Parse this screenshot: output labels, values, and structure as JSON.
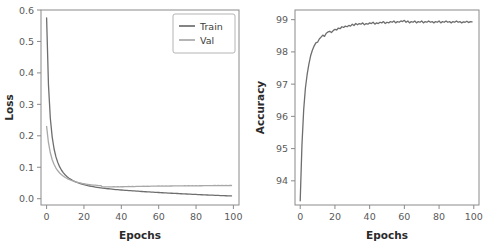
{
  "figure": {
    "background": "#ffffff",
    "panel_count": 2
  },
  "colors": {
    "train": "#6e6e6e",
    "val": "#a8a8a8",
    "accuracy": "#6e6e6e",
    "axis": "#8a8a8a",
    "tick_text": "#5a5a5a",
    "axis_title": "#2b2b2b",
    "legend_border": "#b4b4b4"
  },
  "chart_data": [
    {
      "type": "line",
      "id": "loss-chart",
      "title": "",
      "xlabel": "Epochs",
      "ylabel": "Loss",
      "xlim": [
        -3,
        103
      ],
      "ylim": [
        -0.02,
        0.6
      ],
      "xticks": [
        0,
        20,
        40,
        60,
        80,
        100
      ],
      "xtick_labels": [
        "0",
        "20",
        "40",
        "60",
        "80",
        "100"
      ],
      "yticks": [
        0.0,
        0.1,
        0.2,
        0.3,
        0.4,
        0.5,
        0.6
      ],
      "ytick_labels": [
        "0.0",
        "0.1",
        "0.2",
        "0.3",
        "0.4",
        "0.5",
        "0.6"
      ],
      "grid": false,
      "legend_position": "upper right",
      "legend_entries": [
        "Train",
        "Val"
      ],
      "x": [
        0,
        1,
        2,
        3,
        4,
        5,
        6,
        7,
        8,
        9,
        10,
        11,
        12,
        13,
        14,
        15,
        16,
        17,
        18,
        19,
        20,
        21,
        22,
        23,
        24,
        25,
        26,
        27,
        28,
        29,
        30,
        31,
        32,
        33,
        34,
        35,
        36,
        37,
        38,
        39,
        40,
        41,
        42,
        43,
        44,
        45,
        46,
        47,
        48,
        49,
        50,
        51,
        52,
        53,
        54,
        55,
        56,
        57,
        58,
        59,
        60,
        61,
        62,
        63,
        64,
        65,
        66,
        67,
        68,
        69,
        70,
        71,
        72,
        73,
        74,
        75,
        76,
        77,
        78,
        79,
        80,
        81,
        82,
        83,
        84,
        85,
        86,
        87,
        88,
        89,
        90,
        91,
        92,
        93,
        94,
        95,
        96,
        97,
        98,
        99
      ],
      "series": [
        {
          "name": "Train",
          "color": "#6e6e6e",
          "values": [
            0.575,
            0.362,
            0.255,
            0.196,
            0.158,
            0.133,
            0.115,
            0.101,
            0.0905,
            0.0822,
            0.0755,
            0.07,
            0.0653,
            0.0614,
            0.058,
            0.055,
            0.0524,
            0.0501,
            0.048,
            0.0462,
            0.0445,
            0.043,
            0.0416,
            0.0404,
            0.0392,
            0.0381,
            0.0371,
            0.0362,
            0.0353,
            0.0345,
            0.0337,
            0.033,
            0.0323,
            0.0316,
            0.031,
            0.0304,
            0.0298,
            0.0292,
            0.0287,
            0.0282,
            0.0277,
            0.0272,
            0.0267,
            0.0263,
            0.0258,
            0.0254,
            0.025,
            0.0246,
            0.0242,
            0.0238,
            0.0234,
            0.023,
            0.0226,
            0.0222,
            0.0219,
            0.0215,
            0.0211,
            0.0208,
            0.0204,
            0.0201,
            0.0197,
            0.0194,
            0.019,
            0.0187,
            0.0184,
            0.018,
            0.0177,
            0.0174,
            0.0171,
            0.0168,
            0.0165,
            0.0162,
            0.0158,
            0.0155,
            0.0152,
            0.0149,
            0.0146,
            0.0143,
            0.0141,
            0.0138,
            0.0135,
            0.0132,
            0.0129,
            0.0126,
            0.0124,
            0.0121,
            0.0118,
            0.0116,
            0.0113,
            0.0111,
            0.0108,
            0.0106,
            0.0103,
            0.0101,
            0.0099,
            0.0096,
            0.0094,
            0.0092,
            0.009,
            0.0088
          ]
        },
        {
          "name": "Val",
          "color": "#a8a8a8",
          "values": [
            0.23,
            0.178,
            0.146,
            0.124,
            0.109,
            0.0975,
            0.0888,
            0.0818,
            0.0761,
            0.0714,
            0.0675,
            0.0641,
            0.0612,
            0.0587,
            0.0565,
            0.0546,
            0.0529,
            0.0513,
            0.05,
            0.0487,
            0.0476,
            0.0466,
            0.0457,
            0.0449,
            0.0442,
            0.0435,
            0.0429,
            0.0424,
            0.0419,
            0.0415,
            0.0374,
            0.0372,
            0.0375,
            0.0378,
            0.0374,
            0.0377,
            0.038,
            0.0377,
            0.0382,
            0.0379,
            0.0384,
            0.0381,
            0.0386,
            0.0383,
            0.0388,
            0.0385,
            0.039,
            0.0387,
            0.0392,
            0.0389,
            0.0394,
            0.0391,
            0.0396,
            0.0393,
            0.0398,
            0.0395,
            0.04,
            0.0397,
            0.0402,
            0.0399,
            0.0404,
            0.04,
            0.0405,
            0.0401,
            0.0407,
            0.0403,
            0.0408,
            0.0404,
            0.0409,
            0.0405,
            0.041,
            0.0406,
            0.0411,
            0.0407,
            0.0412,
            0.0408,
            0.0413,
            0.0409,
            0.0414,
            0.041,
            0.0415,
            0.0411,
            0.0416,
            0.0412,
            0.0417,
            0.0413,
            0.0418,
            0.0414,
            0.0419,
            0.0415,
            0.042,
            0.0416,
            0.0421,
            0.0417,
            0.0422,
            0.0418,
            0.0423,
            0.0419,
            0.0424,
            0.042
          ]
        }
      ]
    },
    {
      "type": "line",
      "id": "accuracy-chart",
      "title": "",
      "xlabel": "Epochs",
      "ylabel": "Accuracy",
      "xlim": [
        -3,
        103
      ],
      "ylim": [
        93.25,
        99.3
      ],
      "xticks": [
        0,
        20,
        40,
        60,
        80,
        100
      ],
      "xtick_labels": [
        "0",
        "20",
        "40",
        "60",
        "80",
        "100"
      ],
      "yticks": [
        94,
        95,
        96,
        97,
        98,
        99
      ],
      "ytick_labels": [
        "94",
        "95",
        "96",
        "97",
        "98",
        "99"
      ],
      "grid": false,
      "legend_position": "none",
      "legend_entries": [],
      "x": [
        0,
        1,
        2,
        3,
        4,
        5,
        6,
        7,
        8,
        9,
        10,
        11,
        12,
        13,
        14,
        15,
        16,
        17,
        18,
        19,
        20,
        21,
        22,
        23,
        24,
        25,
        26,
        27,
        28,
        29,
        30,
        31,
        32,
        33,
        34,
        35,
        36,
        37,
        38,
        39,
        40,
        41,
        42,
        43,
        44,
        45,
        46,
        47,
        48,
        49,
        50,
        51,
        52,
        53,
        54,
        55,
        56,
        57,
        58,
        59,
        60,
        61,
        62,
        63,
        64,
        65,
        66,
        67,
        68,
        69,
        70,
        71,
        72,
        73,
        74,
        75,
        76,
        77,
        78,
        79,
        80,
        81,
        82,
        83,
        84,
        85,
        86,
        87,
        88,
        89,
        90,
        91,
        92,
        93,
        94,
        95,
        96,
        97,
        98,
        99
      ],
      "series": [
        {
          "name": "Accuracy",
          "color": "#6e6e6e",
          "values": [
            93.38,
            95.1,
            96.2,
            96.88,
            97.3,
            97.62,
            97.88,
            98.05,
            98.18,
            98.28,
            98.3,
            98.4,
            98.46,
            98.52,
            98.48,
            98.58,
            98.62,
            98.64,
            98.6,
            98.66,
            98.7,
            98.68,
            98.74,
            98.72,
            98.78,
            98.76,
            98.8,
            98.78,
            98.82,
            98.8,
            98.86,
            98.82,
            98.88,
            98.84,
            98.88,
            98.86,
            98.9,
            98.84,
            98.88,
            98.86,
            98.9,
            98.88,
            98.92,
            98.86,
            98.9,
            98.88,
            98.92,
            98.9,
            98.94,
            98.88,
            98.92,
            98.9,
            98.94,
            98.92,
            98.96,
            98.9,
            98.94,
            98.92,
            98.96,
            98.94,
            98.98,
            98.92,
            98.96,
            98.9,
            98.94,
            98.92,
            98.96,
            98.9,
            98.94,
            98.92,
            98.96,
            98.9,
            98.94,
            98.92,
            98.96,
            98.92,
            98.94,
            98.9,
            98.94,
            98.92,
            98.96,
            98.9,
            98.94,
            98.92,
            98.96,
            98.92,
            98.94,
            98.9,
            98.94,
            98.92,
            98.96,
            98.92,
            98.94,
            98.9,
            98.93,
            98.92,
            98.95,
            98.91,
            98.94,
            98.93
          ]
        }
      ]
    }
  ]
}
